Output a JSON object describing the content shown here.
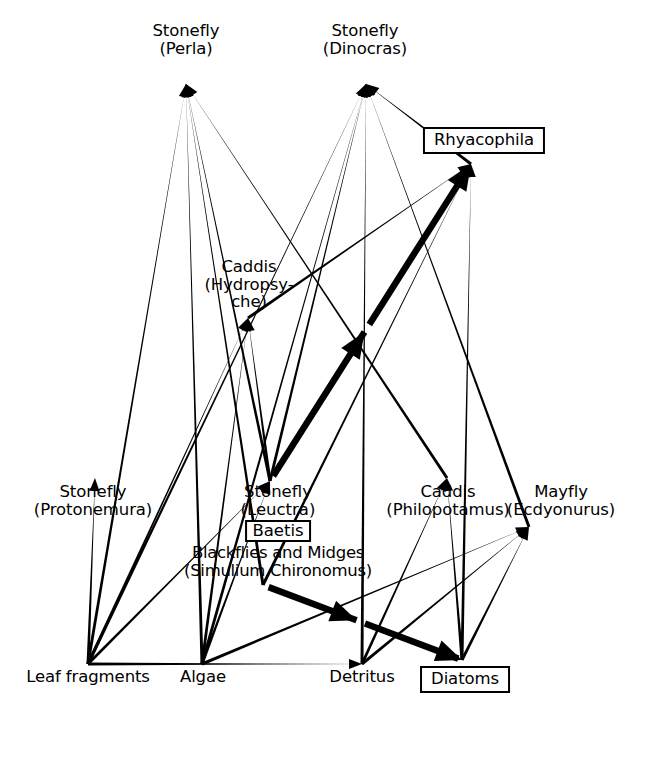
{
  "figure": {
    "type": "food-web-diagram",
    "background_color": "#ffffff",
    "line_color": "#000000",
    "width": 666,
    "height": 757
  },
  "nodes": [
    {
      "id": "perla",
      "label_lines": [
        "Stonefly",
        "(Perla)"
      ],
      "x": 186,
      "y": 22,
      "point_x": 186,
      "point_y": 84,
      "boxed": false,
      "trophic": "top-predator"
    },
    {
      "id": "dinocras",
      "label_lines": [
        "Stonefly",
        "(Dinocras)"
      ],
      "x": 365,
      "y": 22,
      "point_x": 366,
      "point_y": 84,
      "boxed": false,
      "trophic": "top-predator"
    },
    {
      "id": "rhyacophila",
      "label_lines": [
        "Rhyacophila"
      ],
      "x": 484,
      "y": 127,
      "point_x": 471,
      "point_y": 164,
      "boxed": true,
      "trophic": "predator"
    },
    {
      "id": "hydropsyche",
      "label_lines": [
        "Caddis",
        "(Hydropsy-",
        "che)"
      ],
      "x": 249,
      "y": 258,
      "point_x": 248,
      "point_y": 318,
      "boxed": false,
      "trophic": "collector-predator"
    },
    {
      "id": "protonemura",
      "label_lines": [
        "Stonefly",
        "(Protonemura)"
      ],
      "x": 93,
      "y": 483,
      "point_x": 95,
      "point_y": 478,
      "boxed": false,
      "trophic": "shredder"
    },
    {
      "id": "leuctra",
      "label_lines": [
        "Stonefly",
        "(Leuctra)"
      ],
      "x": 272,
      "y": 485,
      "point_x": 270,
      "point_y": 481,
      "boxed": false,
      "trophic": "shredder"
    },
    {
      "id": "baetis",
      "label_lines": [
        "Baetis"
      ],
      "x": 265,
      "y": 526,
      "point_x": 265,
      "point_y": 526,
      "boxed": true,
      "trophic": "grazer"
    },
    {
      "id": "blackflies",
      "label_lines": [
        "Blackflies and Midges",
        "(Simulium Chironomus)"
      ],
      "x": 279,
      "y": 551,
      "point_x": 263,
      "point_y": 585,
      "boxed": false,
      "trophic": "collector"
    },
    {
      "id": "philopotamus",
      "label_lines": [
        "Caddis",
        "(Philopotamus)"
      ],
      "x": 448,
      "y": 483,
      "point_x": 447,
      "point_y": 478,
      "boxed": false,
      "trophic": "filter-feeder"
    },
    {
      "id": "ecdyonurus",
      "label_lines": [
        "Mayfly",
        "(Ecdyonurus)"
      ],
      "x": 561,
      "y": 483,
      "point_x": 529,
      "point_y": 527,
      "boxed": false,
      "trophic": "grazer"
    },
    {
      "id": "leaf",
      "label_lines": [
        "Leaf fragments"
      ],
      "x": 88,
      "y": 668,
      "point_x": 88,
      "point_y": 664,
      "boxed": false,
      "trophic": "basal-resource"
    },
    {
      "id": "algae",
      "label_lines": [
        "Algae"
      ],
      "x": 203,
      "y": 668,
      "point_x": 202,
      "point_y": 664,
      "boxed": false,
      "trophic": "basal-resource"
    },
    {
      "id": "detritus",
      "label_lines": [
        "Detritus"
      ],
      "x": 362,
      "y": 668,
      "point_x": 362,
      "point_y": 664,
      "boxed": false,
      "trophic": "basal-resource"
    },
    {
      "id": "diatoms",
      "label_lines": [
        "Diatoms"
      ],
      "x": 465,
      "y": 668,
      "point_x": 462,
      "point_y": 660,
      "boxed": true,
      "trophic": "basal-resource"
    }
  ],
  "links": [
    {
      "from": "leaf",
      "to": "perla",
      "style": "thin"
    },
    {
      "from": "leuctra",
      "to": "perla",
      "style": "thin"
    },
    {
      "from": "blackflies",
      "to": "perla",
      "style": "thin"
    },
    {
      "from": "philopotamus",
      "to": "perla",
      "style": "thin"
    },
    {
      "from": "algae",
      "to": "perla",
      "style": "thin"
    },
    {
      "from": "leaf",
      "to": "dinocras",
      "style": "thin"
    },
    {
      "from": "algae",
      "to": "dinocras",
      "style": "thin"
    },
    {
      "from": "leuctra",
      "to": "dinocras",
      "style": "thin"
    },
    {
      "from": "detritus",
      "to": "dinocras",
      "style": "thin"
    },
    {
      "from": "ecdyonurus",
      "to": "dinocras",
      "style": "thin"
    },
    {
      "from": "rhyacophila",
      "to": "dinocras",
      "style": "thin"
    },
    {
      "from": "hydropsyche",
      "to": "rhyacophila",
      "style": "thin"
    },
    {
      "from": "blackflies",
      "to": "rhyacophila",
      "style": "thin"
    },
    {
      "from": "diatoms",
      "to": "rhyacophila",
      "style": "thin"
    },
    {
      "from": "leuctra",
      "to": "rhyacophila",
      "style": "thick-dashed"
    },
    {
      "from": "leaf",
      "to": "hydropsyche",
      "style": "thin"
    },
    {
      "from": "algae",
      "to": "hydropsyche",
      "style": "thin"
    },
    {
      "from": "leuctra",
      "to": "hydropsyche",
      "style": "thin"
    },
    {
      "from": "leaf",
      "to": "protonemura",
      "style": "thin"
    },
    {
      "from": "leaf",
      "to": "leuctra",
      "style": "thin"
    },
    {
      "from": "algae",
      "to": "leuctra",
      "style": "thin"
    },
    {
      "from": "detritus",
      "to": "philopotamus",
      "style": "thin"
    },
    {
      "from": "diatoms",
      "to": "philopotamus",
      "style": "thin"
    },
    {
      "from": "algae",
      "to": "ecdyonurus",
      "style": "thin"
    },
    {
      "from": "detritus",
      "to": "ecdyonurus",
      "style": "thin"
    },
    {
      "from": "diatoms",
      "to": "ecdyonurus",
      "style": "thin"
    },
    {
      "from": "blackflies",
      "to": "diatoms",
      "style": "thick-dashed"
    },
    {
      "from": "leaf",
      "to": "detritus",
      "style": "thin"
    }
  ],
  "legend": {
    "thin_meaning": "feeding link",
    "thick_meaning": "emphasised feeding link"
  }
}
